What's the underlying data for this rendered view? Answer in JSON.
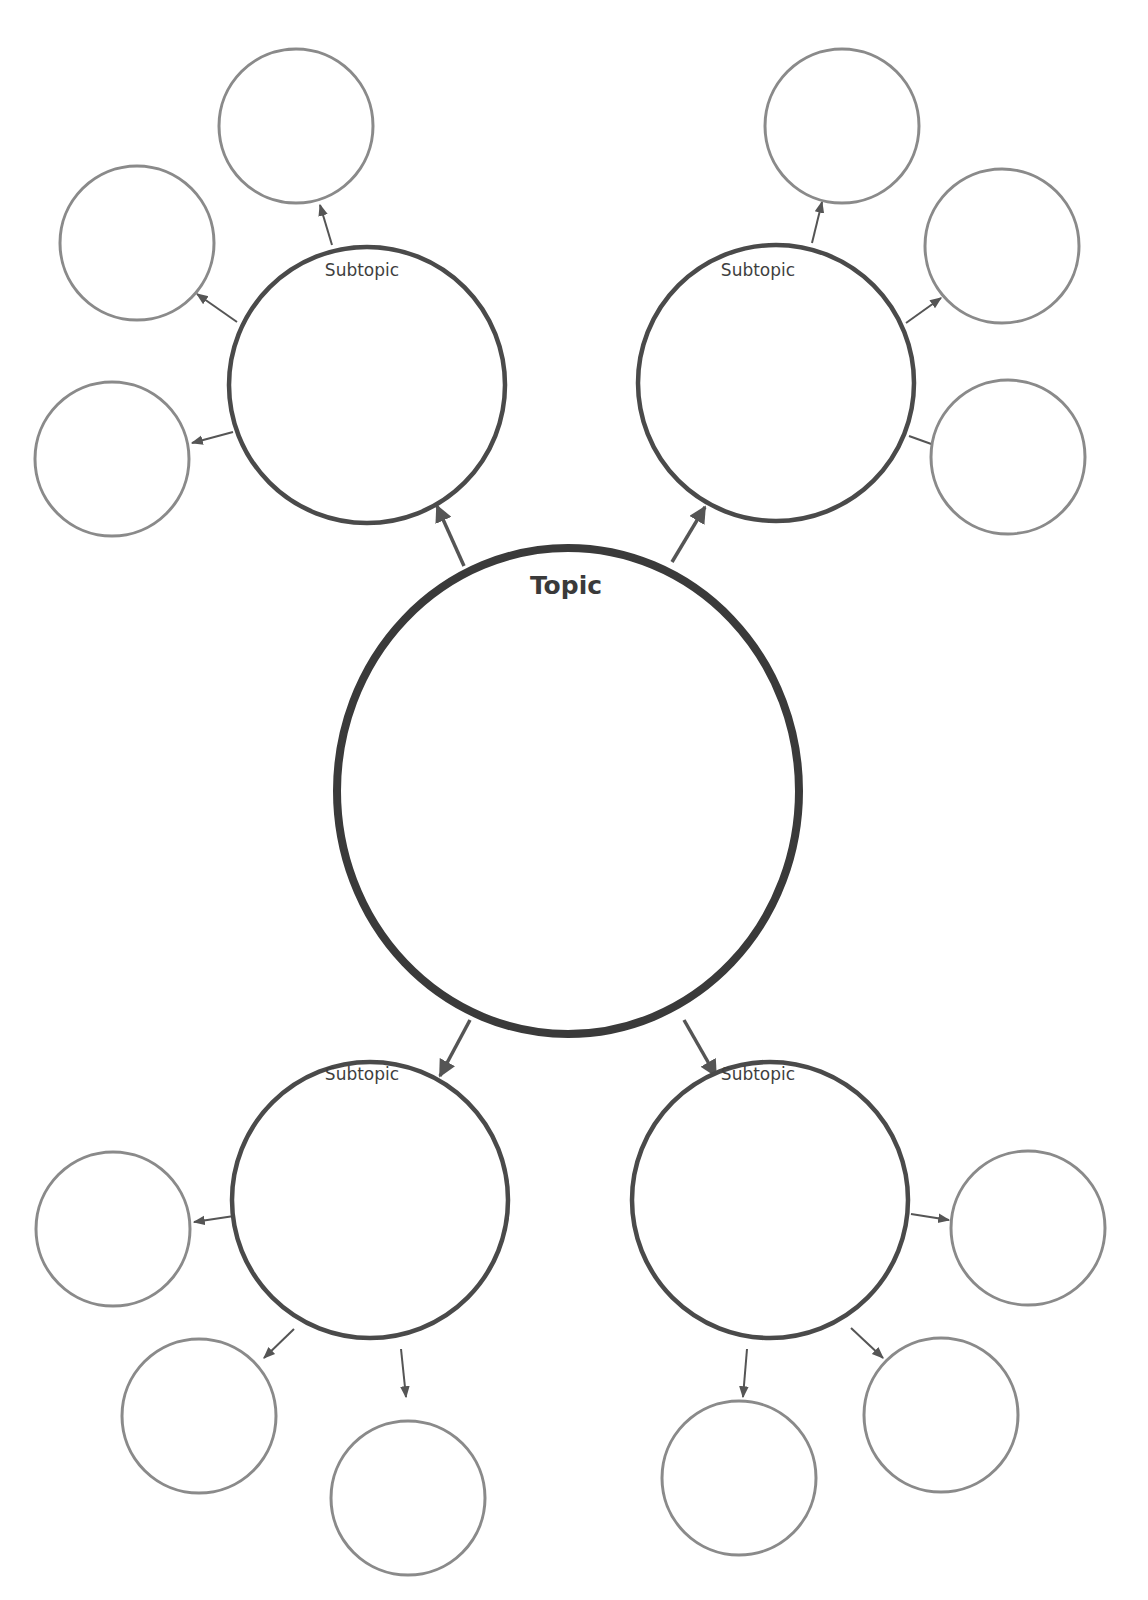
{
  "diagram": {
    "type": "bubble-map",
    "colors": {
      "topic_stroke": "#3a3a3a",
      "subtopic_stroke": "#4a4a4a",
      "detail_stroke": "#8a8a8a",
      "arrow": "#555555",
      "background": "#ffffff"
    },
    "topic": {
      "label": "Topic",
      "cx": 568,
      "cy": 791,
      "rx": 231,
      "ry": 243,
      "stroke_width": 8,
      "label_x": 566,
      "label_y": 594
    },
    "subtopics": [
      {
        "id": "top-left",
        "label": "Subtopic",
        "cx": 367,
        "cy": 385,
        "r": 138,
        "stroke_width": 4.5,
        "label_x": 362,
        "label_y": 276,
        "link_from_topic": {
          "x1": 464,
          "y1": 566,
          "x2": 437,
          "y2": 506
        },
        "details": [
          {
            "cx": 296,
            "cy": 126,
            "r": 77,
            "arrow": {
              "x1": 332,
              "y1": 245,
              "x2": 320,
              "y2": 205
            }
          },
          {
            "cx": 137,
            "cy": 243,
            "r": 77,
            "arrow": {
              "x1": 237,
              "y1": 322,
              "x2": 197,
              "y2": 294
            }
          },
          {
            "cx": 112,
            "cy": 459,
            "r": 77,
            "arrow": {
              "x1": 233,
              "y1": 432,
              "x2": 192,
              "y2": 443
            }
          }
        ]
      },
      {
        "id": "top-right",
        "label": "Subtopic",
        "cx": 776,
        "cy": 383,
        "r": 138,
        "stroke_width": 4.5,
        "label_x": 758,
        "label_y": 276,
        "link_from_topic": {
          "x1": 672,
          "y1": 562,
          "x2": 705,
          "y2": 507
        },
        "details": [
          {
            "cx": 842,
            "cy": 126,
            "r": 77,
            "arrow": {
              "x1": 812,
              "y1": 243,
              "x2": 822,
              "y2": 202
            }
          },
          {
            "cx": 1002,
            "cy": 246,
            "r": 77,
            "arrow": {
              "x1": 906,
              "y1": 323,
              "x2": 941,
              "y2": 298
            }
          },
          {
            "cx": 1008,
            "cy": 457,
            "r": 77,
            "arrow": {
              "x1": 909,
              "y1": 436,
              "x2": 948,
              "y2": 450
            }
          }
        ]
      },
      {
        "id": "bottom-left",
        "label": "Subtopic",
        "cx": 370,
        "cy": 1200,
        "r": 138,
        "stroke_width": 4.5,
        "label_x": 362,
        "label_y": 1080,
        "link_from_topic": {
          "x1": 470,
          "y1": 1020,
          "x2": 440,
          "y2": 1076
        },
        "details": [
          {
            "cx": 113,
            "cy": 1229,
            "r": 77,
            "arrow": {
              "x1": 234,
              "y1": 1216,
              "x2": 194,
              "y2": 1222
            }
          },
          {
            "cx": 199,
            "cy": 1416,
            "r": 77,
            "arrow": {
              "x1": 294,
              "y1": 1329,
              "x2": 264,
              "y2": 1358
            }
          },
          {
            "cx": 408,
            "cy": 1498,
            "r": 77,
            "arrow": {
              "x1": 401,
              "y1": 1349,
              "x2": 406,
              "y2": 1397
            }
          }
        ]
      },
      {
        "id": "bottom-right",
        "label": "Subtopic",
        "cx": 770,
        "cy": 1200,
        "r": 138,
        "stroke_width": 4.5,
        "label_x": 758,
        "label_y": 1080,
        "link_from_topic": {
          "x1": 684,
          "y1": 1020,
          "x2": 716,
          "y2": 1076
        },
        "details": [
          {
            "cx": 1028,
            "cy": 1228,
            "r": 77,
            "arrow": {
              "x1": 911,
              "y1": 1214,
              "x2": 949,
              "y2": 1220
            }
          },
          {
            "cx": 941,
            "cy": 1415,
            "r": 77,
            "arrow": {
              "x1": 851,
              "y1": 1328,
              "x2": 883,
              "y2": 1358
            }
          },
          {
            "cx": 739,
            "cy": 1478,
            "r": 77,
            "arrow": {
              "x1": 747,
              "y1": 1349,
              "x2": 743,
              "y2": 1397
            }
          }
        ]
      }
    ]
  }
}
